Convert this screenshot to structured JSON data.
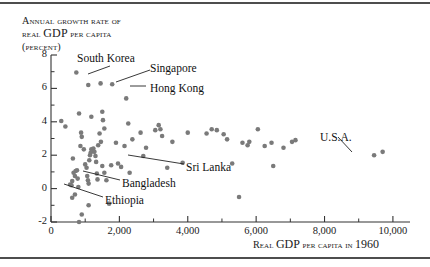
{
  "figure": {
    "has_top_rule": true,
    "has_bottom_rule": true,
    "rule_color": "#4d4d4d",
    "background": "#ffffff"
  },
  "title_lines": {
    "line1_a": "Annual",
    "line1_b": "growth rate of",
    "line2_a": "real",
    "line2_b": "GDP",
    "line2_c": "per capita",
    "line3": "(percent)"
  },
  "xaxis_caption": {
    "a": "Real",
    "b": "GDP",
    "c": "per capita in",
    "d": "1960"
  },
  "chart_data": {
    "type": "scatter",
    "title": "Annual growth rate of real GDP per capita (percent)",
    "xlabel": "Real GDP per capita in 1960",
    "ylabel": "Annual growth rate of real GDP per capita (percent)",
    "xlim": [
      0,
      10500
    ],
    "ylim": [
      -2,
      8
    ],
    "xticks": [
      0,
      2000,
      4000,
      6000,
      8000,
      10000
    ],
    "xtick_labels": [
      "0",
      "2,000",
      "4,000",
      "6,000",
      "8,000",
      "10,000"
    ],
    "xminorticks": [
      1000,
      3000,
      5000,
      7000,
      9000
    ],
    "yticks": [
      -2,
      0,
      2,
      4,
      6,
      8
    ],
    "ytick_labels": [
      "-2",
      "0",
      "2",
      "4",
      "6",
      "8"
    ],
    "yminorticks": [
      -1,
      1,
      3,
      5,
      7
    ],
    "grid": false,
    "legend": "none",
    "marker_color": "#7a7a7a",
    "marker_size_px": 4.6,
    "points": [
      [
        300,
        4.05
      ],
      [
        420,
        3.72
      ],
      [
        820,
        4.5
      ],
      [
        1180,
        4.3
      ],
      [
        1500,
        4.6
      ],
      [
        1520,
        4.1
      ],
      [
        1560,
        3.6
      ],
      [
        2260,
        3.9
      ],
      [
        2200,
        5.4
      ],
      [
        740,
        6.95
      ],
      [
        1090,
        6.2
      ],
      [
        1450,
        6.3
      ],
      [
        1790,
        6.25
      ],
      [
        640,
        1.8
      ],
      [
        620,
        0.45
      ],
      [
        560,
        0.25
      ],
      [
        600,
        0.2
      ],
      [
        660,
        0.95
      ],
      [
        700,
        0.75
      ],
      [
        720,
        1.05
      ],
      [
        760,
        1.1
      ],
      [
        780,
        0.6
      ],
      [
        800,
        0.1
      ],
      [
        700,
        -0.35
      ],
      [
        620,
        -0.55
      ],
      [
        860,
        2.55
      ],
      [
        880,
        3.35
      ],
      [
        900,
        3.1
      ],
      [
        960,
        2.35
      ],
      [
        1000,
        1.45
      ],
      [
        1040,
        1.25
      ],
      [
        1060,
        0.75
      ],
      [
        1080,
        0.5
      ],
      [
        1100,
        0.3
      ],
      [
        1120,
        1.7
      ],
      [
        1140,
        2.0
      ],
      [
        1160,
        2.15
      ],
      [
        1180,
        2.35
      ],
      [
        1210,
        2.25
      ],
      [
        1240,
        2.4
      ],
      [
        1270,
        2.2
      ],
      [
        1300,
        1.95
      ],
      [
        1320,
        1.6
      ],
      [
        1340,
        0.9
      ],
      [
        1360,
        0.55
      ],
      [
        1380,
        2.6
      ],
      [
        1420,
        3.3
      ],
      [
        1460,
        2.8
      ],
      [
        1100,
        -1.0
      ],
      [
        900,
        -1.55
      ],
      [
        820,
        -2.0
      ],
      [
        1500,
        1.35
      ],
      [
        1560,
        0.95
      ],
      [
        1620,
        0.5
      ],
      [
        1700,
        -0.9
      ],
      [
        1760,
        1.4
      ],
      [
        1900,
        2.75
      ],
      [
        1960,
        1.5
      ],
      [
        2050,
        1.3
      ],
      [
        2150,
        2.55
      ],
      [
        2300,
        0.95
      ],
      [
        2380,
        2.95
      ],
      [
        2620,
        3.35
      ],
      [
        2700,
        1.95
      ],
      [
        2780,
        2.45
      ],
      [
        3050,
        3.5
      ],
      [
        3150,
        3.8
      ],
      [
        3200,
        3.55
      ],
      [
        3250,
        3.15
      ],
      [
        3400,
        1.25
      ],
      [
        3550,
        2.8
      ],
      [
        3850,
        1.55
      ],
      [
        4000,
        3.35
      ],
      [
        4550,
        3.3
      ],
      [
        4700,
        3.55
      ],
      [
        4850,
        3.5
      ],
      [
        5050,
        3.25
      ],
      [
        5150,
        2.95
      ],
      [
        5300,
        1.5
      ],
      [
        5600,
        2.75
      ],
      [
        5750,
        2.6
      ],
      [
        5800,
        2.8
      ],
      [
        6050,
        3.55
      ],
      [
        6250,
        2.55
      ],
      [
        6450,
        2.75
      ],
      [
        6500,
        1.35
      ],
      [
        6800,
        2.45
      ],
      [
        7050,
        2.8
      ],
      [
        7150,
        2.9
      ],
      [
        5500,
        -0.5
      ],
      [
        9450,
        2.0
      ],
      [
        9700,
        2.2
      ]
    ]
  },
  "annotations": [
    {
      "label": "South Korea",
      "lx": 77,
      "ly": 52,
      "ax1": 110,
      "ay1": 66,
      "ax2": 88,
      "ay2": 74
    },
    {
      "label": "Singapore",
      "lx": 150,
      "ly": 62,
      "ax1": 150,
      "ay1": 70,
      "ax2": 116,
      "ay2": 82
    },
    {
      "label": "Hong Kong",
      "lx": 150,
      "ly": 82,
      "ax1": 146,
      "ay1": 86,
      "ax2": 130,
      "ay2": 86
    },
    {
      "label": "Sri Lanka",
      "lx": 186,
      "ly": 161,
      "ax1": 184,
      "ay1": 164,
      "ax2": 128,
      "ay2": 155
    },
    {
      "label": "Bangladesh",
      "lx": 122,
      "ly": 177,
      "ax1": 120,
      "ay1": 180,
      "ax2": 83,
      "ay2": 171
    },
    {
      "label": "Ethiopia",
      "lx": 105,
      "ly": 194,
      "ax1": 103,
      "ay1": 197,
      "ax2": 64,
      "ay2": 184
    },
    {
      "label": "U.S.A.",
      "lx": 320,
      "ly": 131,
      "ax1": 338,
      "ay1": 137,
      "ax2": 352,
      "ay2": 152
    }
  ]
}
